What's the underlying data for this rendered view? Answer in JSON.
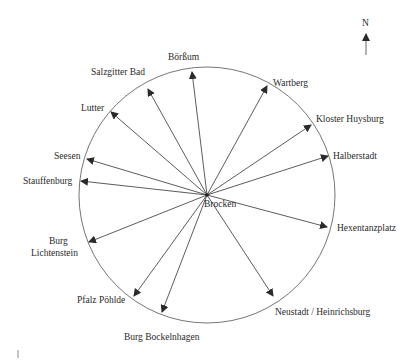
{
  "diagram": {
    "title": "",
    "center": {
      "label": "Brocken",
      "x": 207,
      "y": 195
    },
    "circle": {
      "cx": 207,
      "cy": 195,
      "r": 128
    },
    "north": {
      "label": "N",
      "x": 366,
      "y": 22
    },
    "colors": {
      "line": "#4a4a4a",
      "text": "#2a2a2a",
      "circle": "#666666"
    },
    "targets": [
      {
        "label": "Börßum",
        "tip": [
          192,
          72
        ],
        "text": [
          168,
          60
        ],
        "anchor": "start"
      },
      {
        "label": "Salzgitter Bad",
        "tip": [
          148,
          89
        ],
        "text": [
          91,
          75
        ],
        "anchor": "start"
      },
      {
        "label": "Lutter",
        "tip": [
          111,
          112
        ],
        "text": [
          81,
          111
        ],
        "anchor": "start"
      },
      {
        "label": "Seesen",
        "tip": [
          87,
          159
        ],
        "text": [
          54,
          159
        ],
        "anchor": "start"
      },
      {
        "label": "Stauffenburg",
        "tip": [
          81,
          181
        ],
        "text": [
          23,
          184
        ],
        "anchor": "start"
      },
      {
        "label": "Burg",
        "tip": [
          89,
          242
        ],
        "text": [
          49,
          244
        ],
        "anchor": "start"
      },
      {
        "label": "Lichtenstein",
        "tip": null,
        "text": [
          31,
          256
        ],
        "anchor": "start"
      },
      {
        "label": "Pfalz Pöhlde",
        "tip": [
          134,
          296
        ],
        "text": [
          77,
          303
        ],
        "anchor": "start"
      },
      {
        "label": "Burg Bockelnhagen",
        "tip": [
          162,
          312
        ],
        "text": [
          124,
          340
        ],
        "anchor": "start"
      },
      {
        "label": "Neustadt / Heinrichsburg",
        "tip": [
          273,
          296
        ],
        "text": [
          275,
          315
        ],
        "anchor": "start"
      },
      {
        "label": "Hexentanzplatz",
        "tip": [
          327,
          227
        ],
        "text": [
          337,
          231
        ],
        "anchor": "start"
      },
      {
        "label": "Halberstadt",
        "tip": [
          328,
          156
        ],
        "text": [
          333,
          159
        ],
        "anchor": "start"
      },
      {
        "label": "Kloster Huysburg",
        "tip": [
          311,
          125
        ],
        "text": [
          316,
          122
        ],
        "anchor": "start"
      },
      {
        "label": "Wartberg",
        "tip": [
          267,
          86
        ],
        "text": [
          273,
          86
        ],
        "anchor": "start"
      }
    ]
  }
}
